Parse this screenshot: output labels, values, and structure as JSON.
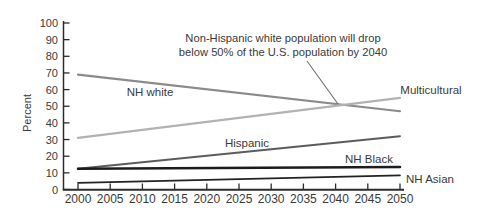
{
  "chart_data": {
    "type": "line",
    "title": "",
    "xlabel": "",
    "ylabel": "Percent",
    "xlim": [
      2000,
      2050
    ],
    "ylim": [
      0,
      100
    ],
    "grid": false,
    "legend_position": "inline-labels",
    "x_ticks": [
      2000,
      2005,
      2010,
      2015,
      2020,
      2025,
      2030,
      2035,
      2040,
      2045,
      2050
    ],
    "y_ticks": [
      0,
      10,
      20,
      30,
      40,
      50,
      60,
      70,
      80,
      90,
      100
    ],
    "background": "#ffffff",
    "axis_color": "#2b2b2b",
    "text_color": "#3a3a3a",
    "annotation": {
      "line1": "Non-Hispanic white population will drop",
      "line2": "below 50% of the U.S. population by 2040",
      "callout_color": "#6e6e6e",
      "points_to": {
        "year": 2041,
        "value": 50.5
      }
    },
    "series": [
      {
        "name": "NH white",
        "color": "#8a8a8a",
        "width": 2.2,
        "x": [
          2000,
          2050
        ],
        "values": [
          69,
          47
        ]
      },
      {
        "name": "Multicultural",
        "color": "#b2b2b2",
        "width": 2.2,
        "x": [
          2000,
          2050
        ],
        "values": [
          31,
          55
        ]
      },
      {
        "name": "Hispanic",
        "color": "#5c5c5c",
        "width": 2.0,
        "x": [
          2000,
          2050
        ],
        "values": [
          12.5,
          32
        ]
      },
      {
        "name": "NH Black",
        "color": "#1c1c1c",
        "width": 2.5,
        "x": [
          2000,
          2050
        ],
        "values": [
          12.5,
          13.5
        ]
      },
      {
        "name": "NH Asian",
        "color": "#222222",
        "width": 1.7,
        "x": [
          2000,
          2050
        ],
        "values": [
          4,
          8.5
        ]
      }
    ]
  }
}
